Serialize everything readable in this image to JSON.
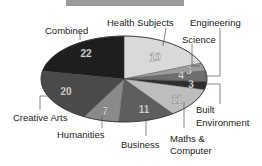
{
  "chart_data": {
    "type": "pie",
    "title": "",
    "start_angle": "12 o'clock",
    "direction": "clockwise",
    "categories": [
      "Health Subjects",
      "Science",
      "Engineering",
      "Built Environment",
      "Maths & Computer",
      "Business",
      "Humanities",
      "Creative Arts",
      "Combined"
    ],
    "values": [
      19,
      3,
      4,
      3,
      11,
      11,
      7,
      20,
      22
    ],
    "colors": [
      "#d9d9d9",
      "#9c9c9c",
      "#6e6e6e",
      "#2e2e2e",
      "#bdbdbd",
      "#5e5e5e",
      "#8a8a8a",
      "#4a4a4a",
      "#1e1e1e"
    ],
    "data_labels": [
      "19",
      "3",
      "4",
      "3",
      "11",
      "11",
      "7",
      "20",
      "22"
    ],
    "legend": "none (callout labels)"
  },
  "labels": {
    "health": "Health Subjects",
    "engineering": "Engineering",
    "science": "Science",
    "combined": "Combined",
    "built1": "Built",
    "built2": "Environment",
    "maths1": "Maths &",
    "maths2": "Computer",
    "business": "Business",
    "humanities": "Humanities",
    "creative": "Creative Arts"
  },
  "values": {
    "health": "19",
    "science": "3",
    "engineering": "4",
    "built": "3",
    "maths": "11",
    "business": "11",
    "humanities": "7",
    "creative": "20",
    "combined": "22"
  }
}
